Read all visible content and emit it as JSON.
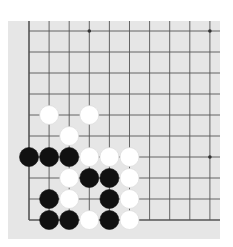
{
  "board": {
    "background": "#e6e6e6",
    "line_color": "#555555",
    "origin_x": 29,
    "origin_y": 31,
    "spacing_x": 20.1,
    "spacing_y": 21.0,
    "cols": 10,
    "rows": 10,
    "edges": [
      "left",
      "bottom"
    ],
    "star_points": [
      [
        3,
        0
      ],
      [
        9,
        0
      ],
      [
        9,
        6
      ]
    ],
    "stone_radius": 9.5
  },
  "stones": [
    {
      "color": "white",
      "col": 1,
      "row": 4
    },
    {
      "color": "white",
      "col": 3,
      "row": 4
    },
    {
      "color": "white",
      "col": 2,
      "row": 5
    },
    {
      "color": "black",
      "col": 0,
      "row": 6
    },
    {
      "color": "black",
      "col": 1,
      "row": 6
    },
    {
      "color": "black",
      "col": 2,
      "row": 6
    },
    {
      "color": "white",
      "col": 3,
      "row": 6
    },
    {
      "color": "white",
      "col": 4,
      "row": 6
    },
    {
      "color": "white",
      "col": 5,
      "row": 6
    },
    {
      "color": "white",
      "col": 2,
      "row": 7
    },
    {
      "color": "black",
      "col": 3,
      "row": 7
    },
    {
      "color": "black",
      "col": 4,
      "row": 7
    },
    {
      "color": "white",
      "col": 5,
      "row": 7
    },
    {
      "color": "black",
      "col": 1,
      "row": 8
    },
    {
      "color": "white",
      "col": 2,
      "row": 8
    },
    {
      "color": "black",
      "col": 4,
      "row": 8
    },
    {
      "color": "white",
      "col": 5,
      "row": 8
    },
    {
      "color": "black",
      "col": 1,
      "row": 9
    },
    {
      "color": "black",
      "col": 2,
      "row": 9
    },
    {
      "color": "white",
      "col": 3,
      "row": 9
    },
    {
      "color": "black",
      "col": 4,
      "row": 9
    },
    {
      "color": "white",
      "col": 5,
      "row": 9
    }
  ]
}
